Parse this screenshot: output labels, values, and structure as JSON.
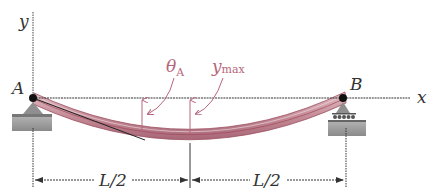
{
  "diagram": {
    "axes": {
      "y_label": "y",
      "x_label": "x"
    },
    "points": {
      "left_support": "A",
      "right_support": "B"
    },
    "annotations": {
      "slope": {
        "symbol": "θ",
        "subscript": "A"
      },
      "deflection": {
        "symbol": "y",
        "subscript": "max"
      }
    },
    "dimensions": [
      {
        "label": "L/2"
      },
      {
        "label": "L/2"
      }
    ],
    "colors": {
      "beam": "#c58d98",
      "beam_edge": "#9a4e60",
      "annotation": "#b5667a",
      "support": "#9a9a9a",
      "line": "#333333"
    }
  }
}
